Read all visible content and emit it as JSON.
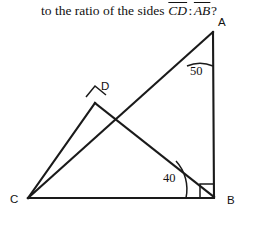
{
  "question": {
    "lead": "to the ratio of the sides",
    "segment_1": "CD",
    "separator": ":",
    "segment_2": "AB",
    "trailing": "?"
  },
  "figure": {
    "type": "geometry-diagram",
    "vertices": [
      {
        "name": "A",
        "label": "A",
        "x": 213,
        "y": 32,
        "label_x": 218,
        "label_y": 26
      },
      {
        "name": "B",
        "label": "B",
        "x": 214,
        "y": 197,
        "label_x": 227,
        "label_y": 204
      },
      {
        "name": "C",
        "label": "C",
        "x": 28,
        "y": 198,
        "label_x": 10,
        "label_y": 203
      },
      {
        "name": "D",
        "label": "D",
        "x": 95,
        "y": 103,
        "label_x": 101,
        "label_y": 90
      }
    ],
    "segments": [
      {
        "name": "side-AB",
        "from": "A",
        "to": "B"
      },
      {
        "name": "side-CB",
        "from": "C",
        "to": "B"
      },
      {
        "name": "side-CA",
        "from": "C",
        "to": "A"
      },
      {
        "name": "segment-DB",
        "from": "D",
        "to": "B"
      },
      {
        "name": "segment-CD",
        "from": "C",
        "to": "D"
      }
    ],
    "angles": [
      {
        "name": "angle-at-A",
        "vertex": "A",
        "value": "50",
        "label_x": 190,
        "label_y": 75
      },
      {
        "name": "angle-at-B",
        "vertex": "B",
        "value": "40",
        "label_x": 163,
        "label_y": 182
      }
    ],
    "right_angles": [
      {
        "name": "right-angle-at-B",
        "vertex": "B"
      },
      {
        "name": "right-angle-at-D",
        "vertex": "D"
      }
    ],
    "colors": {
      "stroke": "#1a1a1a",
      "background": "#ffffff",
      "text": "#111111"
    }
  }
}
